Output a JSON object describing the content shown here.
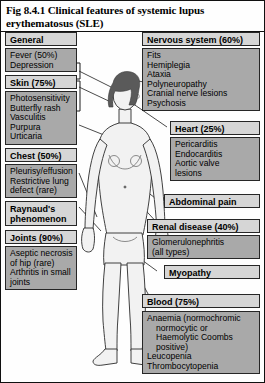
{
  "figure": {
    "title": "Fig 8.4.1 Clinical features of systemic lupus erythematosus (SLE)",
    "colors": {
      "header_fill": "#d6d6d6",
      "content_fill": "#a9a9a9",
      "border": "#262626",
      "hair": "#5a5a5a"
    }
  },
  "left_column": [
    {
      "header": "General",
      "items": [
        "Fever (50%)",
        "Depression"
      ]
    },
    {
      "header": "Skin (75%)",
      "items": [
        "Photosensitivity",
        "Butterfly rash",
        "Vasculitis",
        "Purpura",
        "Urticaria"
      ]
    },
    {
      "header": "Chest (50%)",
      "items": [
        "Pleurisy/effusion",
        "Restrictive lung",
        "defect (rare)"
      ]
    },
    {
      "header": "Raynaud's phenomenon",
      "items": []
    },
    {
      "header": "Joints (90%)",
      "items": [
        "Aseptic necrosis",
        "of hip (rare)",
        "Arthritis in small",
        "joints"
      ]
    }
  ],
  "right_column": [
    {
      "header": "Nervous system (60%)",
      "items": [
        "Fits",
        "Hemiplegia",
        "Ataxia",
        "Polyneuropathy",
        "Cranial nerve lesions",
        "Psychosis"
      ]
    },
    {
      "header": "Heart (25%)",
      "items": [
        "Pericarditis",
        "Endocarditis",
        "Aortic valve",
        "lesions"
      ]
    },
    {
      "header": "Abdominal pain",
      "items": []
    },
    {
      "header": "Renal disease (40%)",
      "items": [
        "Glomerulonephritis",
        "(all types)"
      ]
    },
    {
      "header": "Myopathy",
      "items": []
    },
    {
      "header": "Blood (75%)",
      "items": [
        "Anaemia (normochromic",
        "normocytic or",
        "Haemolytic Coombs",
        "positive)",
        "Leucopenia",
        "Thrombocytopenia"
      ]
    }
  ],
  "central_figure": {
    "label": "female human body anatomical line drawing"
  }
}
